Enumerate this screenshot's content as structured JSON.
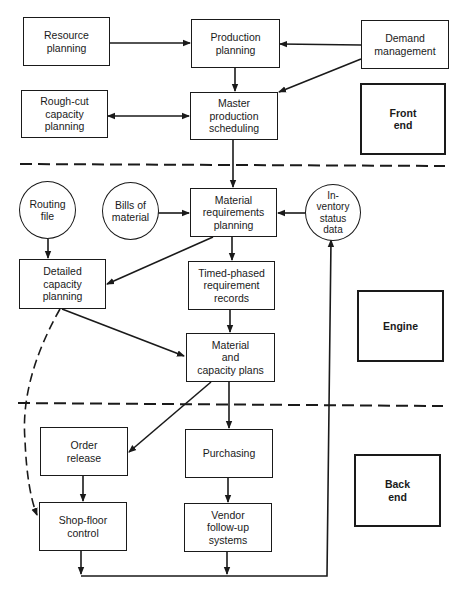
{
  "diagram": {
    "sections": {
      "front_end": "Front\nend",
      "engine": "Engine",
      "back_end": "Back\nend"
    },
    "nodes": {
      "resource_planning": "Resource\nplanning",
      "production_planning": "Production\nplanning",
      "demand_management": "Demand\nmanagement",
      "rough_cut_capacity_planning": "Rough-cut\ncapacity\nplanning",
      "master_production_scheduling": "Master\nproduction\nscheduling",
      "routing_file": "Routing\nfile",
      "bills_of_material": "Bills of\nmaterial",
      "material_requirements_planning": "Material\nrequirements\nplanning",
      "inventory_status_data": "In-\nventory\nstatus\ndata",
      "detailed_capacity_planning": "Detailed\ncapacity\nplanning",
      "timed_phased_requirement_records": "Timed-phased\nrequirement\nrecords",
      "material_and_capacity_plans": "Material\nand\ncapacity plans",
      "order_release": "Order\nrelease",
      "purchasing": "Purchasing",
      "shop_floor_control": "Shop-floor\ncontrol",
      "vendor_follow_up_systems": "Vendor\nfollow-up\nsystems"
    },
    "edges": [
      {
        "from": "Resource planning",
        "to": "Production planning",
        "style": "solid"
      },
      {
        "from": "Demand management",
        "to": "Production planning",
        "style": "solid"
      },
      {
        "from": "Demand management",
        "to": "Master production scheduling",
        "style": "solid"
      },
      {
        "from": "Production planning",
        "to": "Master production scheduling",
        "style": "solid"
      },
      {
        "from": "Rough-cut capacity planning",
        "to": "Master production scheduling",
        "style": "bidirectional"
      },
      {
        "from": "Master production scheduling",
        "to": "Material requirements planning",
        "style": "solid"
      },
      {
        "from": "Bills of material",
        "to": "Material requirements planning",
        "style": "solid"
      },
      {
        "from": "Inventory status data",
        "to": "Material requirements planning",
        "style": "solid"
      },
      {
        "from": "Routing file",
        "to": "Detailed capacity planning",
        "style": "solid"
      },
      {
        "from": "Material requirements planning",
        "to": "Detailed capacity planning",
        "style": "solid"
      },
      {
        "from": "Material requirements planning",
        "to": "Timed-phased requirement records",
        "style": "solid"
      },
      {
        "from": "Timed-phased requirement records",
        "to": "Material and capacity plans",
        "style": "solid"
      },
      {
        "from": "Detailed capacity planning",
        "to": "Material and capacity plans",
        "style": "solid"
      },
      {
        "from": "Detailed capacity planning",
        "to": "Shop-floor control",
        "style": "dashed"
      },
      {
        "from": "Material and capacity plans",
        "to": "Order release",
        "style": "solid"
      },
      {
        "from": "Material and capacity plans",
        "to": "Purchasing",
        "style": "solid"
      },
      {
        "from": "Order release",
        "to": "Shop-floor control",
        "style": "solid"
      },
      {
        "from": "Purchasing",
        "to": "Vendor follow-up systems",
        "style": "solid"
      },
      {
        "from": "Shop-floor control",
        "to": "Inventory status data",
        "style": "solid"
      },
      {
        "from": "Vendor follow-up systems",
        "to": "Inventory status data",
        "style": "solid"
      }
    ],
    "colors": {
      "line": "#1a1a1a",
      "background": "#ffffff"
    }
  }
}
